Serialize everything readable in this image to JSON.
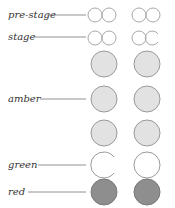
{
  "rows": [
    {
      "id": "pre-stage",
      "label": "pre-stage",
      "state": "both lamps lit (outline)"
    },
    {
      "id": "stage",
      "label": "stage",
      "state": "left side both lit, right side one partially"
    },
    {
      "id": "amber",
      "label": "amber",
      "count": 3
    },
    {
      "id": "green",
      "label": "green"
    },
    {
      "id": "red",
      "label": "red"
    }
  ],
  "colors": {
    "outline": "#a8a8a8",
    "amber_fill": "#e2e2e2",
    "red_fill": "#8e8e8e",
    "text": "#333333"
  }
}
